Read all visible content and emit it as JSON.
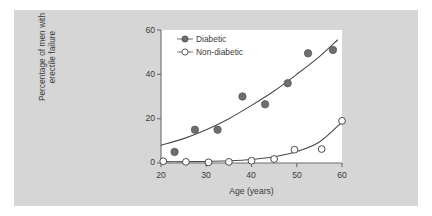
{
  "figure": {
    "background_color": "#d6d6d6",
    "plot_background_color": "#ffffff",
    "axis_color": "#6e6e6e",
    "text_color": "#3a3a3a"
  },
  "legend": {
    "position": "top-left-inside",
    "entries": [
      {
        "label": "Diabetic",
        "marker": "filled-circle",
        "color": "#6e6e6e"
      },
      {
        "label": "Non-diabetic",
        "marker": "open-circle",
        "color": "#ffffff"
      }
    ]
  },
  "axes": {
    "x": {
      "label": "Age (years)",
      "ticks": [
        "20",
        "30",
        "40",
        "50",
        "60"
      ],
      "min": 20,
      "max": 60
    },
    "y": {
      "label_line1": "Percentage of men with",
      "label_line2": "erectile failure",
      "ticks": [
        "0",
        "20",
        "40",
        "60"
      ],
      "min": 0,
      "max": 60
    }
  },
  "chart_data": {
    "type": "scatter",
    "title": "",
    "xlabel": "Age (years)",
    "ylabel": "Percentage of men with erectile failure",
    "xlim": [
      20,
      60
    ],
    "ylim": [
      0,
      60
    ],
    "xticks": [
      20,
      30,
      40,
      50,
      60
    ],
    "yticks": [
      0,
      20,
      40,
      60
    ],
    "grid": false,
    "legend_position": "upper left",
    "series": [
      {
        "name": "Diabetic",
        "marker": "filled-circle",
        "color": "#6e6e6e",
        "points": [
          {
            "x": 23.0,
            "y": 5.0
          },
          {
            "x": 27.5,
            "y": 15.0
          },
          {
            "x": 32.5,
            "y": 15.0
          },
          {
            "x": 38.0,
            "y": 30.0
          },
          {
            "x": 43.0,
            "y": 26.5
          },
          {
            "x": 48.0,
            "y": 36.0
          },
          {
            "x": 52.5,
            "y": 49.5
          },
          {
            "x": 58.0,
            "y": 51.0
          }
        ],
        "fit_curve": [
          {
            "x": 20.0,
            "y": 8.0
          },
          {
            "x": 25.0,
            "y": 11.0
          },
          {
            "x": 30.0,
            "y": 15.0
          },
          {
            "x": 35.0,
            "y": 20.0
          },
          {
            "x": 40.0,
            "y": 26.0
          },
          {
            "x": 45.0,
            "y": 32.5
          },
          {
            "x": 50.0,
            "y": 40.0
          },
          {
            "x": 55.0,
            "y": 48.0
          },
          {
            "x": 59.0,
            "y": 55.5
          }
        ]
      },
      {
        "name": "Non-diabetic",
        "marker": "open-circle",
        "color": "#ffffff",
        "points": [
          {
            "x": 20.5,
            "y": 0.8
          },
          {
            "x": 25.5,
            "y": 0.5
          },
          {
            "x": 30.5,
            "y": 0.3
          },
          {
            "x": 35.0,
            "y": 0.5
          },
          {
            "x": 40.0,
            "y": 1.0
          },
          {
            "x": 45.0,
            "y": 1.8
          },
          {
            "x": 49.5,
            "y": 6.0
          },
          {
            "x": 55.5,
            "y": 6.3
          },
          {
            "x": 60.0,
            "y": 19.0
          }
        ],
        "fit_curve": [
          {
            "x": 20.0,
            "y": 0.6
          },
          {
            "x": 25.0,
            "y": 0.6
          },
          {
            "x": 30.0,
            "y": 0.7
          },
          {
            "x": 35.0,
            "y": 1.0
          },
          {
            "x": 40.0,
            "y": 1.6
          },
          {
            "x": 45.0,
            "y": 2.8
          },
          {
            "x": 50.0,
            "y": 5.2
          },
          {
            "x": 55.0,
            "y": 9.5
          },
          {
            "x": 60.0,
            "y": 18.5
          }
        ]
      }
    ]
  }
}
